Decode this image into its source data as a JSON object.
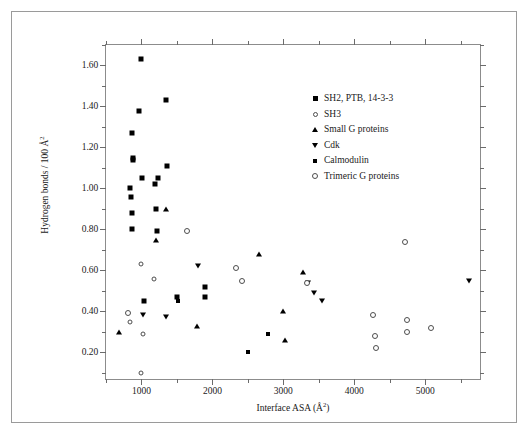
{
  "chart_data": {
    "type": "scatter",
    "title": "",
    "xlabel": "Interface ASA (Å²)",
    "ylabel": "Hydrogen bonds / 100 Å²",
    "xlim": [
      500,
      5800
    ],
    "ylim": [
      0.06,
      1.7
    ],
    "xticks": [
      1000,
      2000,
      3000,
      4000,
      5000
    ],
    "xtick_labels": [
      "1000",
      "2000",
      "3000",
      "4000",
      "5000"
    ],
    "x_minor_step": 500,
    "yticks": [
      0.2,
      0.4,
      0.6,
      0.8,
      1.0,
      1.2,
      1.4,
      1.6
    ],
    "ytick_labels": [
      "0.20",
      "0.40",
      "0.60",
      "0.80",
      "1.00",
      "1.20",
      "1.40",
      "1.60"
    ],
    "y_minor_step": 0.1,
    "grid": false,
    "legend_position": "upper-right-inside",
    "series": [
      {
        "name": "SH2, PTB, 14-3-3",
        "marker": "filled-square",
        "points": [
          [
            1000,
            1.63
          ],
          [
            960,
            1.38
          ],
          [
            870,
            1.27
          ],
          [
            1340,
            1.43
          ],
          [
            880,
            1.15
          ],
          [
            880,
            1.14
          ],
          [
            1360,
            1.11
          ],
          [
            1010,
            1.05
          ],
          [
            1230,
            1.05
          ],
          [
            1190,
            1.02
          ],
          [
            840,
            1.0
          ],
          [
            850,
            0.96
          ],
          [
            870,
            0.88
          ],
          [
            1200,
            0.9
          ],
          [
            870,
            0.8
          ],
          [
            1220,
            0.79
          ],
          [
            1900,
            0.52
          ],
          [
            1890,
            0.47
          ],
          [
            1500,
            0.47
          ],
          [
            1040,
            0.45
          ]
        ]
      },
      {
        "name": "SH3",
        "marker": "open-circle-small",
        "points": [
          [
            1000,
            0.63
          ],
          [
            1180,
            0.56
          ],
          [
            840,
            0.35
          ],
          [
            1020,
            0.29
          ],
          [
            1000,
            0.1
          ]
        ]
      },
      {
        "name": "Small G proteins",
        "marker": "triangle-up",
        "points": [
          [
            1340,
            0.9
          ],
          [
            1200,
            0.75
          ],
          [
            2660,
            0.68
          ],
          [
            3270,
            0.59
          ],
          [
            3000,
            0.4
          ],
          [
            1780,
            0.33
          ],
          [
            3030,
            0.26
          ],
          [
            680,
            0.3
          ]
        ]
      },
      {
        "name": "Cdk",
        "marker": "triangle-down",
        "points": [
          [
            1800,
            0.62
          ],
          [
            3350,
            0.54
          ],
          [
            3430,
            0.49
          ],
          [
            3540,
            0.45
          ],
          [
            5620,
            0.55
          ],
          [
            1020,
            0.38
          ],
          [
            1340,
            0.37
          ]
        ]
      },
      {
        "name": "Calmodulin",
        "marker": "filled-square-small",
        "points": [
          [
            1510,
            0.45
          ],
          [
            2780,
            0.29
          ],
          [
            2500,
            0.2
          ]
        ]
      },
      {
        "name": "Trimeric G proteins",
        "marker": "open-circle",
        "points": [
          [
            1640,
            0.79
          ],
          [
            4710,
            0.74
          ],
          [
            2330,
            0.61
          ],
          [
            2420,
            0.55
          ],
          [
            3340,
            0.54
          ],
          [
            4270,
            0.38
          ],
          [
            4740,
            0.36
          ],
          [
            5080,
            0.32
          ],
          [
            4740,
            0.3
          ],
          [
            4290,
            0.28
          ],
          [
            4300,
            0.22
          ],
          [
            810,
            0.39
          ]
        ]
      }
    ]
  },
  "legend": {
    "entries": [
      {
        "label": "SH2, PTB, 14-3-3",
        "marker": "filled-square"
      },
      {
        "label": "SH3",
        "marker": "open-circle-small"
      },
      {
        "label": "Small G proteins",
        "marker": "triangle-up"
      },
      {
        "label": "Cdk",
        "marker": "triangle-down"
      },
      {
        "label": "Calmodulin",
        "marker": "filled-square-small"
      },
      {
        "label": "Trimeric G proteins",
        "marker": "open-circle"
      }
    ]
  },
  "axes": {
    "y_title_prefix": "Hydrogen bonds / 100 Å",
    "y_title_sup": "2",
    "x_title_prefix": "Interface ASA (Å",
    "x_title_sup": "2",
    "x_title_suffix": ")"
  },
  "colors": {
    "marker": "#000000",
    "open_marker_stroke": "#4d4d4d",
    "axis": "#8c8c8c",
    "frame": "#9a9a9a",
    "text": "#1a1a1a",
    "background": "#ffffff"
  }
}
